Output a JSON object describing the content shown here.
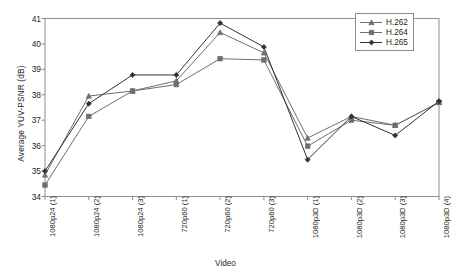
{
  "chart_data": {
    "type": "line",
    "title": "",
    "xlabel": "Video",
    "ylabel": "Average YUV-PSNR (dB)",
    "categories": [
      "1080p24 (1)",
      "1080p24 (2)",
      "1080p24 (3)",
      "720p60 (1)",
      "720p60 (2)",
      "720p60 (3)",
      "1080p3D (1)",
      "1080p3D (2)",
      "1080p3D (3)",
      "1080p3D (4)"
    ],
    "ylim": [
      34,
      41
    ],
    "yticks": [
      34,
      35,
      36,
      37,
      38,
      39,
      40,
      41
    ],
    "grid": false,
    "legend_position": "top-right",
    "series": [
      {
        "name": "H.262",
        "marker": "triangle",
        "color": "#6e6e6e",
        "values": [
          34.85,
          37.95,
          38.15,
          38.55,
          40.45,
          39.65,
          36.3,
          37.15,
          36.8,
          37.7
        ]
      },
      {
        "name": "H.264",
        "marker": "square",
        "color": "#6e6e6e",
        "values": [
          34.45,
          37.15,
          38.15,
          38.4,
          39.42,
          39.37,
          35.98,
          37.0,
          36.8,
          37.7
        ]
      },
      {
        "name": "H.265",
        "marker": "diamond",
        "color": "#333333",
        "values": [
          35.0,
          37.65,
          38.78,
          38.78,
          40.82,
          39.88,
          35.45,
          37.15,
          36.4,
          37.75
        ]
      }
    ]
  },
  "axis": {
    "frame_color": "#8e8e8e"
  }
}
